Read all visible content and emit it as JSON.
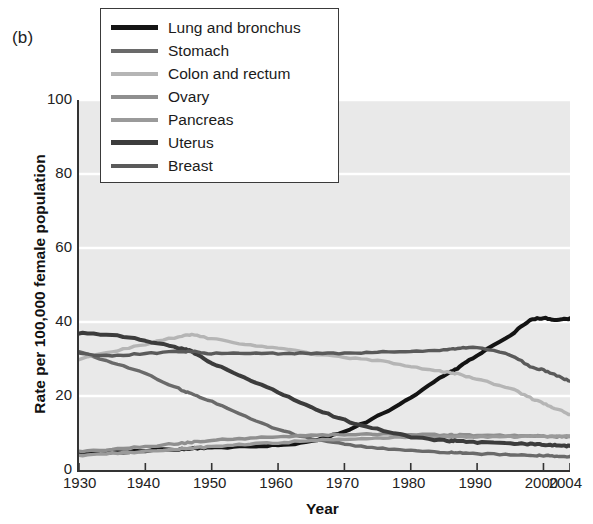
{
  "figure": {
    "panel_label": "(b)",
    "background_color": "#ffffff",
    "plot_background_color": "#e9e9e9",
    "gridline_color": "#ffffff",
    "axis_color": "#333333"
  },
  "chart_data": {
    "type": "line",
    "title": "",
    "panel": "(b)",
    "xlabel": "Year",
    "ylabel": "Rate per 100,000 female population",
    "xlim": [
      1930,
      2004
    ],
    "ylim": [
      0,
      100
    ],
    "xticks": [
      1930,
      1940,
      1950,
      1960,
      1970,
      1980,
      1990,
      2000,
      2004
    ],
    "xticklabels": [
      "1930",
      "1940",
      "1950",
      "1960",
      "1970",
      "1980",
      "1990",
      "2000",
      "2004"
    ],
    "yticks": [
      0,
      20,
      40,
      60,
      80,
      100
    ],
    "yticklabels": [
      "0",
      "20",
      "40",
      "60",
      "80",
      "100"
    ],
    "grid": "horizontal",
    "legend_position": "upper-left-inside",
    "x": [
      1930,
      1935,
      1940,
      1945,
      1947,
      1950,
      1955,
      1960,
      1965,
      1970,
      1975,
      1980,
      1985,
      1987,
      1990,
      1995,
      1998,
      2000,
      2002,
      2004
    ],
    "series": [
      {
        "name": "Lung and bronchus",
        "color": "#141414",
        "values": [
          4.5,
          4.8,
          5.2,
          5.6,
          5.8,
          6.0,
          6.3,
          6.8,
          7.8,
          10.5,
          14.5,
          19.5,
          25.5,
          27.5,
          31.0,
          36.5,
          40.5,
          41.0,
          40.5,
          41.0
        ]
      },
      {
        "name": "Stomach",
        "color": "#6a6a6a",
        "values": [
          32.0,
          29.0,
          26.0,
          22.0,
          20.5,
          18.5,
          14.5,
          11.0,
          8.5,
          7.0,
          6.0,
          5.3,
          4.8,
          4.6,
          4.4,
          4.2,
          4.0,
          3.9,
          3.8,
          3.7
        ]
      },
      {
        "name": "Colon and rectum",
        "color": "#b5b5b5",
        "values": [
          30.0,
          32.0,
          34.0,
          36.0,
          36.5,
          35.5,
          34.0,
          33.0,
          31.5,
          30.5,
          29.5,
          28.0,
          26.5,
          26.0,
          24.5,
          22.0,
          19.5,
          18.0,
          16.5,
          15.0
        ]
      },
      {
        "name": "Ovary",
        "color": "#8f8f8f",
        "values": [
          5.0,
          5.6,
          6.3,
          7.2,
          7.5,
          8.0,
          8.5,
          9.0,
          9.3,
          9.6,
          9.7,
          9.6,
          9.5,
          9.5,
          9.4,
          9.3,
          9.2,
          9.1,
          9.0,
          9.0
        ]
      },
      {
        "name": "Pancreas",
        "color": "#9a9a9a",
        "values": [
          4.0,
          4.5,
          5.0,
          5.6,
          5.9,
          6.3,
          6.9,
          7.4,
          7.9,
          8.3,
          8.6,
          8.8,
          8.9,
          8.9,
          9.0,
          9.0,
          9.1,
          9.1,
          9.1,
          9.2
        ]
      },
      {
        "name": "Uterus",
        "color": "#3c3c3c",
        "values": [
          37.0,
          36.5,
          35.0,
          33.0,
          32.0,
          29.0,
          25.0,
          21.0,
          17.0,
          13.5,
          11.0,
          9.0,
          8.0,
          7.8,
          7.5,
          7.2,
          7.0,
          6.8,
          6.6,
          6.5
        ]
      },
      {
        "name": "Breast",
        "color": "#5a5a5a",
        "values": [
          31.5,
          31.0,
          31.5,
          32.0,
          32.0,
          31.5,
          31.5,
          31.5,
          31.5,
          31.5,
          31.8,
          32.0,
          32.5,
          32.8,
          33.0,
          31.0,
          28.0,
          27.0,
          25.5,
          24.0
        ]
      }
    ]
  },
  "legend": {
    "items": [
      {
        "label": "Lung and bronchus",
        "color": "#141414",
        "width": 4.5
      },
      {
        "label": "Stomach",
        "color": "#6a6a6a",
        "width": 4
      },
      {
        "label": "Colon and rectum",
        "color": "#b5b5b5",
        "width": 4
      },
      {
        "label": "Ovary",
        "color": "#8f8f8f",
        "width": 4
      },
      {
        "label": "Pancreas",
        "color": "#9a9a9a",
        "width": 4
      },
      {
        "label": "Uterus",
        "color": "#3c3c3c",
        "width": 4.5
      },
      {
        "label": "Breast",
        "color": "#5a5a5a",
        "width": 4
      }
    ]
  }
}
